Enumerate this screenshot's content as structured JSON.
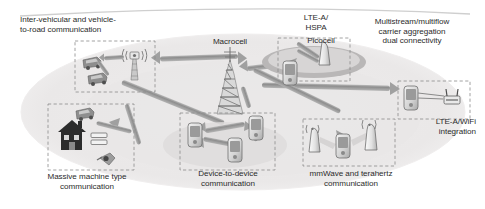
{
  "figure": {
    "type": "diagram",
    "background_color": "#ffffff",
    "ellipse_color": "#eceaea",
    "arrow_color": "#9a9a9a",
    "dashed_box_color": "#8c8c8c",
    "text_color": "#2b2b2b"
  },
  "labels": {
    "intervehicular": "Inter-vehicular and vehicle-\nto-road communication",
    "macrocell": "Macrocell",
    "lte_hspa": "LTE-A/\nHSPA",
    "picocell": "Picocell",
    "multistream": "Multistream/multiflow\ncarrier aggregation\ndual connectivity",
    "lte_wifi": "LTE-A/WiFi\nintegration",
    "massive_mtc": "Massive machine type\ncommunication",
    "d2d": "Device-to-device\ncommunication",
    "mmwave": "mmWave and terahertz\ncommunication"
  },
  "regions": [
    {
      "id": "intervehicular",
      "label": "Inter-vehicular and vehicle-to-road communication",
      "contents": [
        "car",
        "car",
        "roadside-antenna"
      ]
    },
    {
      "id": "massive-mtc",
      "label": "Massive machine type communication",
      "contents": [
        "house",
        "car",
        "smart-meter",
        "sensor"
      ]
    },
    {
      "id": "device-to-device",
      "label": "Device-to-device communication",
      "contents": [
        "phone",
        "phone",
        "phone"
      ]
    },
    {
      "id": "picocell",
      "label": "Picocell",
      "contents": [
        "picocell-antenna",
        "phone"
      ]
    },
    {
      "id": "mmwave",
      "label": "mmWave and terahertz communication",
      "contents": [
        "small-cell-antenna",
        "phone",
        "small-cell-antenna"
      ]
    },
    {
      "id": "lte-wifi",
      "label": "LTE-A/WiFi integration",
      "contents": [
        "phone",
        "wifi-router"
      ]
    }
  ],
  "central_node": {
    "id": "macrocell",
    "label": "Macrocell",
    "type": "lattice-tower"
  }
}
